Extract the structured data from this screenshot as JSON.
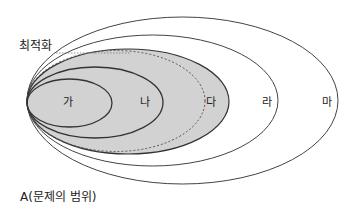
{
  "diagram": {
    "title_label": "A(문제의 범위)",
    "optimization_label": "최적화",
    "regions": [
      {
        "id": "ga",
        "label": "가"
      },
      {
        "id": "na",
        "label": "나"
      },
      {
        "id": "da",
        "label": "다"
      },
      {
        "id": "ra",
        "label": "라"
      },
      {
        "id": "ma",
        "label": "마"
      }
    ],
    "colors": {
      "highlight_fill": "#d2d2d2",
      "stroke": "#333333",
      "background": "#ffffff"
    }
  }
}
